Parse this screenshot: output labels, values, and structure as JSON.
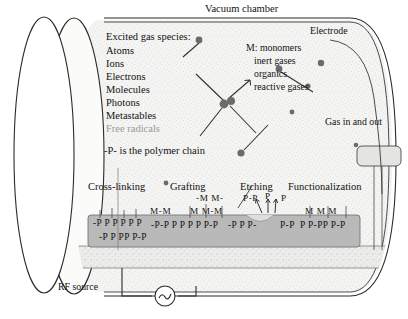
{
  "figure": {
    "type": "schematic-diagram"
  },
  "labels": {
    "vacuum_chamber": "Vacuum chamber",
    "electrode": "Electrode",
    "gas_in_out": "Gas in and out",
    "rf_source": "RF source"
  },
  "species_list": {
    "heading": "Excited gas species:",
    "items": [
      "Atoms",
      "Ions",
      "Electrons",
      "Molecules",
      "Photons",
      "Metastables",
      "Free radicals"
    ]
  },
  "monomer_list": {
    "heading": "M: monomers",
    "items": [
      "inert gases",
      "organics",
      "reactive gases"
    ]
  },
  "legend": {
    "polymer_note": "-P- is the polymer chain"
  },
  "processes": [
    {
      "name": "Cross-linking"
    },
    {
      "name": "Grafting"
    },
    {
      "name": "Etching"
    },
    {
      "name": "Functionalization"
    }
  ],
  "surface": {
    "crosslink_row_top": "-P P P P P  P",
    "crosslink_row_bottom": "-P P PP P-P",
    "grafting_m_upper": "-M M-",
    "grafting_m_lower_left": "M-M",
    "grafting_m_lower_right": "M M-M",
    "grafting_chain": "-P-P P P P P  P-P",
    "etching_eject_upper": "P-P",
    "etching_eject_mid": "P",
    "etching_eject_right": "P",
    "etching_chain_left": "-P P P-",
    "etching_chain_right": "P-P",
    "functional_m": "M  M  M",
    "functional_chain": "P P-PP  P-P"
  },
  "colors": {
    "plasma_fill": "#f2f2f0",
    "polymer_block": "#b9b9b9",
    "electrode_plate": "#e9e9e7",
    "outline": "#2b2b2b",
    "text": "#121212"
  }
}
